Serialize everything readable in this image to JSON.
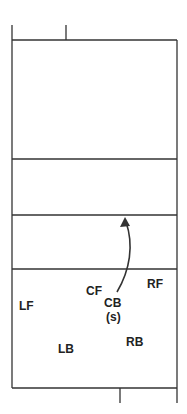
{
  "diagram": {
    "type": "volleyball-court-positions",
    "line_color": "#333333",
    "positions": [
      {
        "id": "lf",
        "label": "LF"
      },
      {
        "id": "cf",
        "label": "CF"
      },
      {
        "id": "rf",
        "label": "RF"
      },
      {
        "id": "cb",
        "label": "CB"
      },
      {
        "id": "cb_note",
        "label": "(s)"
      },
      {
        "id": "lb",
        "label": "LB"
      },
      {
        "id": "rb",
        "label": "RB"
      }
    ],
    "arrow": {
      "from": "CB",
      "to": "attack line",
      "description": "setter moves forward"
    }
  }
}
